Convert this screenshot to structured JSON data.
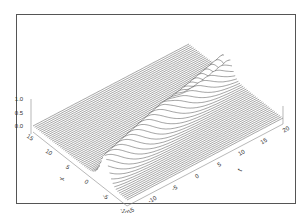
{
  "chart_data": {
    "type": "surface",
    "title": "",
    "x_axis": {
      "label": "x",
      "ticks": [
        15,
        10,
        5,
        0,
        -5,
        -10
      ],
      "range": [
        -10,
        15
      ]
    },
    "t_axis": {
      "label": "t",
      "ticks": [
        -15,
        -10,
        -5,
        0,
        5,
        10,
        15,
        20
      ],
      "range": [
        -15,
        20
      ]
    },
    "u_axis": {
      "label": "",
      "ticks": [
        "0.0",
        "0.5",
        "1.0"
      ],
      "range": [
        0,
        1
      ]
    },
    "surface": {
      "description": "Wireframe surface u(x,t): flat at 0 except a single localized ridge of height ~1 travelling diagonally across the (x,t) plane, with a narrow dip splitting the ridge near the back (breather/soliton-like).",
      "peak_height": 1.0,
      "ridge_path": [
        {
          "t": -15,
          "x": -4
        },
        {
          "t": 0,
          "x": 0
        },
        {
          "t": 20,
          "x": 5
        }
      ],
      "ridge_width": 2.5,
      "grid_lines_along_t": 60
    },
    "colors": {
      "line": "#333333",
      "frame": "#555555",
      "background": "#ffffff"
    }
  }
}
